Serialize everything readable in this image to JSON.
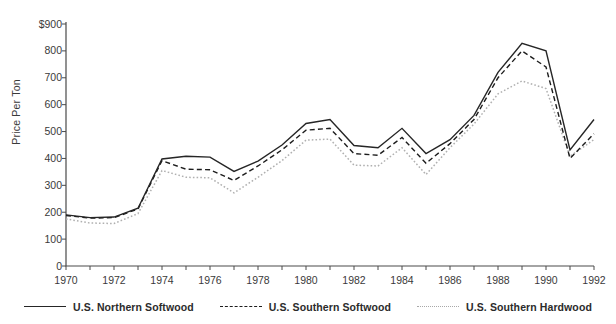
{
  "chart_data": {
    "type": "line",
    "title": "",
    "xlabel": "",
    "ylabel": "Price Per Ton",
    "x": [
      1970,
      1971,
      1972,
      1973,
      1974,
      1975,
      1976,
      1977,
      1978,
      1979,
      1980,
      1981,
      1982,
      1983,
      1984,
      1985,
      1986,
      1987,
      1988,
      1989,
      1990,
      1991,
      1992
    ],
    "xlim": [
      1970,
      1992
    ],
    "ylim": [
      0,
      900
    ],
    "ytick_values": [
      0,
      100,
      200,
      300,
      400,
      500,
      600,
      700,
      800,
      900
    ],
    "ytick_labels": [
      "0",
      "100",
      "200",
      "300",
      "400",
      "500",
      "600",
      "700",
      "800",
      "$900"
    ],
    "xtick_labels": [
      "1970",
      "1972",
      "1974",
      "1976",
      "1978",
      "1980",
      "1982",
      "1984",
      "1986",
      "1988",
      "1990",
      "1992"
    ],
    "xtick_values": [
      1970,
      1972,
      1974,
      1976,
      1978,
      1980,
      1982,
      1984,
      1986,
      1988,
      1990,
      1992
    ],
    "grid": false,
    "legend_position": "bottom",
    "series": [
      {
        "name": "U.S. Northern Softwood",
        "style": "solid",
        "color": "#262626",
        "values": [
          190,
          180,
          182,
          215,
          398,
          408,
          405,
          352,
          390,
          450,
          530,
          545,
          448,
          440,
          512,
          418,
          470,
          560,
          720,
          828,
          800,
          432,
          545
        ]
      },
      {
        "name": "U.S. Southern Softwood",
        "style": "dashed",
        "color": "#1d1d1d",
        "values": [
          188,
          178,
          180,
          212,
          392,
          360,
          358,
          318,
          372,
          432,
          505,
          512,
          418,
          412,
          478,
          382,
          455,
          545,
          700,
          800,
          740,
          400,
          492
        ]
      },
      {
        "name": "U.S. Southern Hardwood",
        "style": "dotted",
        "color": "#b0b0b0",
        "values": [
          175,
          160,
          158,
          195,
          355,
          330,
          328,
          272,
          330,
          392,
          468,
          472,
          375,
          372,
          440,
          340,
          440,
          528,
          640,
          688,
          660,
          408,
          470
        ]
      }
    ]
  },
  "axes": {
    "y_axis_title": "Price Per Ton"
  },
  "legend": {
    "items": [
      {
        "label": "U.S. Northern Softwood",
        "style": "solid"
      },
      {
        "label": "U.S. Southern Softwood",
        "style": "dashed"
      },
      {
        "label": "U.S. Southern Hardwood",
        "style": "dotted"
      }
    ]
  }
}
